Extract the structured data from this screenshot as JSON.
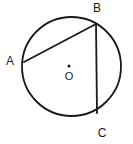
{
  "figure": {
    "kind": "circle-geometry-diagram",
    "canvas": {
      "width": 133,
      "height": 144
    },
    "background_color": "#ffffff",
    "stroke_color": "#1a1a1a",
    "label_color": "#1a1a1a",
    "circle": {
      "name": "main-circle",
      "center_x": 71.5,
      "center_y": 66.5,
      "radius": 49.5,
      "stroke_width": 1.8,
      "fill": "none"
    },
    "center_point": {
      "label": "O",
      "dot_x": 69,
      "dot_y": 66,
      "dot_radius": 1.5,
      "label_x": 69,
      "label_y": 77.5
    },
    "points": [
      {
        "id": "A",
        "label": "A",
        "x": 24,
        "y": 62,
        "label_x": 10,
        "label_y": 62
      },
      {
        "id": "B",
        "label": "B",
        "x": 96,
        "y": 24,
        "label_x": 97,
        "label_y": 9
      },
      {
        "id": "C",
        "label": "C",
        "x": 97,
        "y": 113,
        "label_x": 102,
        "label_y": 134
      }
    ],
    "chords": [
      {
        "id": "AB",
        "from": "A",
        "to": "B",
        "x1": 24,
        "y1": 62,
        "x2": 96,
        "y2": 24,
        "stroke_width": 1.8
      },
      {
        "id": "BC",
        "from": "B",
        "to": "C",
        "x1": 96,
        "y1": 24,
        "x2": 97,
        "y2": 113,
        "stroke_width": 1.8
      }
    ]
  }
}
